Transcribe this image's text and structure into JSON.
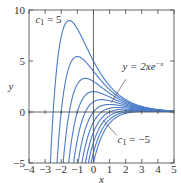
{
  "chart_data": {
    "type": "line",
    "title": "",
    "xlabel": "x",
    "ylabel": "y",
    "xlim": [
      -4,
      5
    ],
    "ylim": [
      -5,
      10
    ],
    "grid": false,
    "family": "y = (2x + c1) e^(-x)",
    "x_ticks": [
      -4,
      -3,
      -2,
      -1,
      0,
      1,
      2,
      3,
      4,
      5
    ],
    "x_tick_labels": [
      "−4",
      "−3",
      "−2",
      "−1",
      "0",
      "1",
      "2",
      "3",
      "4",
      "5"
    ],
    "y_ticks": [
      -5,
      0,
      5,
      10
    ],
    "y_tick_labels": [
      "−5",
      "0",
      "5",
      "10"
    ],
    "series": [
      {
        "name": "c1 = 5",
        "c1": 5
      },
      {
        "name": "c1 = 4",
        "c1": 4
      },
      {
        "name": "c1 = 3",
        "c1": 3
      },
      {
        "name": "c1 = 2",
        "c1": 2
      },
      {
        "name": "c1 = 1",
        "c1": 1
      },
      {
        "name": "c1 = 0 (y = 2xe^-x)",
        "c1": 0
      },
      {
        "name": "c1 = -1",
        "c1": -1
      },
      {
        "name": "c1 = -2",
        "c1": -2
      },
      {
        "name": "c1 = -3",
        "c1": -3
      },
      {
        "name": "c1 = -4",
        "c1": -4
      },
      {
        "name": "c1 = -5",
        "c1": -5
      }
    ],
    "annotations": [
      {
        "text_prefix": "c",
        "subscript": "1",
        "text_suffix": " = 5",
        "refers_to": "c1 = 5"
      },
      {
        "text": "y = 2xe",
        "superscript": "−x",
        "refers_to": "c1 = 0"
      },
      {
        "text_prefix": "c",
        "subscript": "1",
        "text_suffix": " = −5",
        "refers_to": "c1 = -5"
      }
    ],
    "curve_color": "#4a7cc9",
    "axis_color": "#555555"
  }
}
